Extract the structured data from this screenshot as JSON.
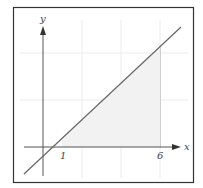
{
  "figure": {
    "x_axis_label": "x",
    "y_axis_label": "y",
    "tick_labels": [
      "1",
      "6"
    ],
    "colors": {
      "frame": "#333333",
      "axis": "#555555",
      "line": "#666666",
      "grid": "#ececec",
      "shade": "#f2f2f2"
    }
  }
}
